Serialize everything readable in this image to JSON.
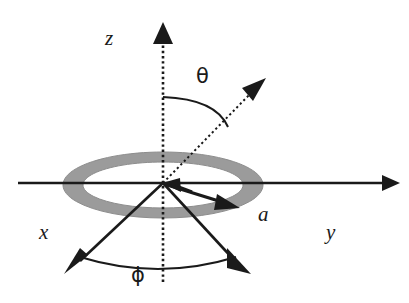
{
  "figure": {
    "background_color": "#ffffff",
    "width": 409,
    "height": 303
  },
  "labels": {
    "z_axis": "z",
    "x_axis": "x",
    "y_axis": "y",
    "ring_radius": "a",
    "polar_angle": "θ",
    "azimuthal_angle": "ϕ"
  },
  "colors": {
    "ink": "#1a1a1a",
    "ring_fill": "#9b9b9b",
    "ring_stroke": "#8f8f8f",
    "background": "#ffffff"
  },
  "geometry": {
    "origin": {
      "x": 163,
      "y": 183
    },
    "ring": {
      "center_x": 163,
      "center_y": 185,
      "outer_rx": 100,
      "outer_ry": 33,
      "inner_rx": 80,
      "inner_ry": 23,
      "style": "gray annulus drawn in perspective as an ellipse"
    },
    "z_axis": {
      "style": "dotted",
      "from": {
        "x": 163,
        "y": 280
      },
      "to": {
        "x": 163,
        "y": 22
      },
      "arrowhead": "up"
    },
    "y_axis": {
      "style": "solid",
      "from": {
        "x": 18,
        "y": 183
      },
      "to": {
        "x": 396,
        "y": 183
      },
      "arrowhead": "right"
    },
    "x_axis": {
      "style": "solid",
      "from": {
        "x": 163,
        "y": 183
      },
      "to": {
        "x": 68,
        "y": 272
      },
      "arrowhead": "down-left"
    },
    "radial_ray": {
      "style": "dotted",
      "from": {
        "x": 163,
        "y": 183
      },
      "to": {
        "x": 264,
        "y": 80
      },
      "arrowhead": "up-right"
    },
    "projection_ray": {
      "style": "solid",
      "from": {
        "x": 163,
        "y": 183
      },
      "to": {
        "x": 247,
        "y": 272
      },
      "arrowhead": "down-right"
    },
    "short_vector_inbound": {
      "style": "solid-thick",
      "from": {
        "x": 186,
        "y": 190
      },
      "to": {
        "x": 166,
        "y": 184
      },
      "arrowhead": "pointing-to-origin"
    },
    "short_vector_outbound": {
      "style": "solid-thick",
      "from": {
        "x": 163,
        "y": 183
      },
      "to": {
        "x": 235,
        "y": 206
      },
      "arrowhead": "down-right"
    },
    "theta_arc": {
      "from": {
        "x": 163,
        "y": 97
      },
      "to": {
        "x": 228,
        "y": 126
      },
      "between": "z-axis and radial ray"
    },
    "phi_arc": {
      "from": {
        "x": 80,
        "y": 257
      },
      "to": {
        "x": 236,
        "y": 257
      },
      "sag_y": 273,
      "between": "x-axis and projection ray"
    }
  }
}
